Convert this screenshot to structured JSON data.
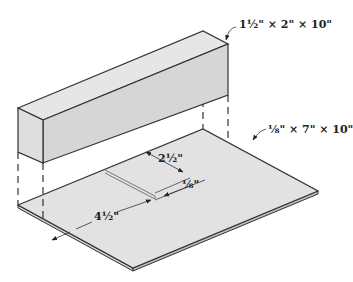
{
  "figure": {
    "colors": {
      "fill": "#dcdcdc",
      "fill_light": "#e8e8e8",
      "stroke": "#333333",
      "background": "#ffffff"
    }
  },
  "labels": {
    "block_dimensions": "1½\" × 2\" × 10\"",
    "plate_dimensions": "⅛\" × 7\" × 10\"",
    "slot_length": "2½\"",
    "slot_width": "⅛\"",
    "slot_offset": "4½\""
  }
}
